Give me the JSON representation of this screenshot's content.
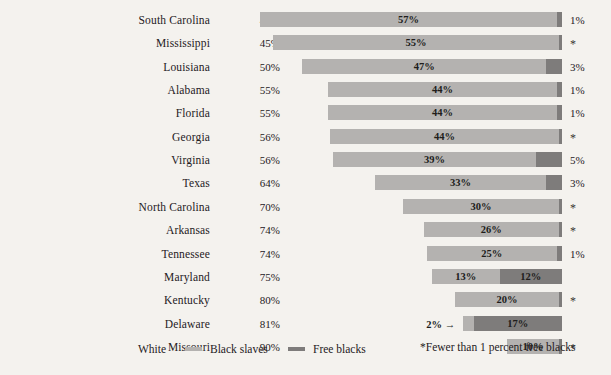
{
  "chart_data": {
    "type": "bar",
    "subtype": "stacked-horizontal-100percent",
    "title": "",
    "xlabel": "",
    "ylabel": "",
    "xlim": [
      0,
      100
    ],
    "grid": false,
    "legend_position": "bottom-left",
    "categories": [
      "South Carolina",
      "Mississippi",
      "Louisiana",
      "Alabama",
      "Florida",
      "Georgia",
      "Virginia",
      "Texas",
      "North Carolina",
      "Arkansas",
      "Tennessee",
      "Maryland",
      "Kentucky",
      "Delaware",
      "Missouri"
    ],
    "series": [
      {
        "name": "White",
        "color": "#f4f2ee",
        "values": [
          42,
          45,
          50,
          55,
          55,
          56,
          56,
          64,
          70,
          74,
          74,
          75,
          80,
          81,
          90
        ]
      },
      {
        "name": "Black slaves",
        "color": "#b4b2b0",
        "values": [
          57,
          55,
          47,
          44,
          44,
          44,
          39,
          33,
          30,
          26,
          25,
          13,
          20,
          2,
          10
        ]
      },
      {
        "name": "Free blacks",
        "color": "#7e7c7b",
        "values": [
          1,
          0.5,
          3,
          1,
          1,
          0.5,
          5,
          3,
          0.5,
          0.5,
          1,
          12,
          0.5,
          17,
          0.5
        ]
      }
    ]
  },
  "rows": [
    {
      "state": "South Carolina",
      "white": "42%",
      "slaves": 57,
      "slaves_label": "57%",
      "free": 1,
      "free_label": "1%",
      "free_is_star": false,
      "slaves_label_outside": false
    },
    {
      "state": "Mississippi",
      "white": "45%",
      "slaves": 55,
      "slaves_label": "55%",
      "free": 0.6,
      "free_label": "*",
      "free_is_star": true,
      "slaves_label_outside": false
    },
    {
      "state": "Louisiana",
      "white": "50%",
      "slaves": 47,
      "slaves_label": "47%",
      "free": 3,
      "free_label": "3%",
      "free_is_star": false,
      "slaves_label_outside": false
    },
    {
      "state": "Alabama",
      "white": "55%",
      "slaves": 44,
      "slaves_label": "44%",
      "free": 1,
      "free_label": "1%",
      "free_is_star": false,
      "slaves_label_outside": false
    },
    {
      "state": "Florida",
      "white": "55%",
      "slaves": 44,
      "slaves_label": "44%",
      "free": 1,
      "free_label": "1%",
      "free_is_star": false,
      "slaves_label_outside": false
    },
    {
      "state": "Georgia",
      "white": "56%",
      "slaves": 44,
      "slaves_label": "44%",
      "free": 0.6,
      "free_label": "*",
      "free_is_star": true,
      "slaves_label_outside": false
    },
    {
      "state": "Virginia",
      "white": "56%",
      "slaves": 39,
      "slaves_label": "39%",
      "free": 5,
      "free_label": "5%",
      "free_is_star": false,
      "slaves_label_outside": false
    },
    {
      "state": "Texas",
      "white": "64%",
      "slaves": 33,
      "slaves_label": "33%",
      "free": 3,
      "free_label": "3%",
      "free_is_star": false,
      "slaves_label_outside": false
    },
    {
      "state": "North Carolina",
      "white": "70%",
      "slaves": 30,
      "slaves_label": "30%",
      "free": 0.6,
      "free_label": "*",
      "free_is_star": true,
      "slaves_label_outside": false
    },
    {
      "state": "Arkansas",
      "white": "74%",
      "slaves": 26,
      "slaves_label": "26%",
      "free": 0.6,
      "free_label": "*",
      "free_is_star": true,
      "slaves_label_outside": false
    },
    {
      "state": "Tennessee",
      "white": "74%",
      "slaves": 25,
      "slaves_label": "25%",
      "free": 1,
      "free_label": "1%",
      "free_is_star": false,
      "slaves_label_outside": false
    },
    {
      "state": "Maryland",
      "white": "75%",
      "slaves": 13,
      "slaves_label": "13%",
      "free": 12,
      "free_label": "12%",
      "free_is_star": false,
      "slaves_label_outside": false,
      "free_label_inside": "12%"
    },
    {
      "state": "Kentucky",
      "white": "80%",
      "slaves": 20,
      "slaves_label": "20%",
      "free": 0.6,
      "free_label": "*",
      "free_is_star": true,
      "slaves_label_outside": false
    },
    {
      "state": "Delaware",
      "white": "81%",
      "slaves": 2,
      "slaves_label": "2%",
      "free": 17,
      "free_label": "",
      "free_is_star": false,
      "slaves_label_outside": true,
      "free_label_inside": "17%"
    },
    {
      "state": "Missouri",
      "white": "90%",
      "slaves": 10,
      "slaves_label": "10%",
      "free": 0.6,
      "free_label": "*",
      "free_is_star": true,
      "slaves_label_outside": false
    }
  ],
  "legend": {
    "white_label": "White",
    "slaves_label": "Black slaves",
    "free_label": "Free blacks",
    "white_color": "#f4f2ee",
    "slaves_color": "#b4b2b0",
    "free_color": "#7e7c7b"
  },
  "footnote": "*Fewer than 1 percent free blacks"
}
